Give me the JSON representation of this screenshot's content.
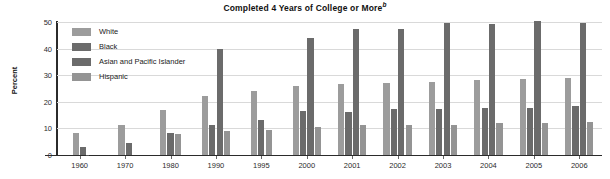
{
  "chart_data": {
    "type": "bar",
    "title": "Completed 4 Years of College or More",
    "title_superscript": "b",
    "xlabel": "",
    "ylabel": "Percent",
    "ylim": [
      0,
      50
    ],
    "yticks": [
      0,
      10,
      20,
      30,
      40,
      50
    ],
    "grid": true,
    "legend_position": "top-left-inside",
    "categories": [
      "1960",
      "1970",
      "1980",
      "1990",
      "1995",
      "2000",
      "2001",
      "2002",
      "2003",
      "2004",
      "2005",
      "2006"
    ],
    "series": [
      {
        "name": "White",
        "color": "#9c9c9c",
        "values": [
          8.1,
          11.3,
          17.1,
          22.0,
          24.0,
          26.1,
          26.6,
          27.2,
          27.6,
          28.2,
          28.4,
          29.0
        ]
      },
      {
        "name": "Black",
        "color": "#6b6b6b",
        "values": [
          3.1,
          4.4,
          8.4,
          11.3,
          13.2,
          16.5,
          16.1,
          17.2,
          17.3,
          17.6,
          17.5,
          18.5
        ]
      },
      {
        "name": "Asian and Pacific Islander",
        "color": "#6b6b6b",
        "values": [
          null,
          null,
          null,
          39.9,
          null,
          43.9,
          47.2,
          47.2,
          49.8,
          49.4,
          50.2,
          49.7
        ]
      },
      {
        "name": "Hispanic",
        "color": "#949494",
        "values": [
          null,
          null,
          7.9,
          9.2,
          9.3,
          10.6,
          11.1,
          11.1,
          11.4,
          12.1,
          12.0,
          12.4
        ]
      }
    ]
  },
  "legend": {
    "items": [
      {
        "label": "White",
        "color": "#9c9c9c"
      },
      {
        "label": "Black",
        "color": "#6b6b6b"
      },
      {
        "label": "Asian and Pacific Islander",
        "color": "#6b6b6b"
      },
      {
        "label": "Hispanic",
        "color": "#949494"
      }
    ]
  }
}
